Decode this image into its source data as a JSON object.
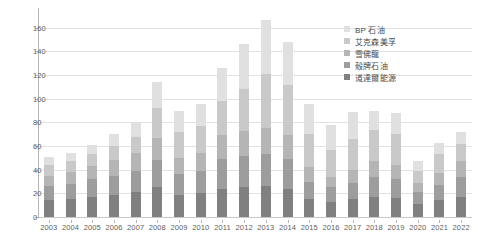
{
  "chart_data": {
    "type": "bar",
    "stacked": true,
    "title": "",
    "subtitle": "",
    "xlabel": "",
    "ylabel": "",
    "ylim": [
      0,
      170
    ],
    "y_ticks": [
      0,
      20,
      40,
      60,
      80,
      100,
      120,
      140,
      160
    ],
    "grid": true,
    "legend_position": "top-right",
    "categories": [
      "2003",
      "2004",
      "2005",
      "2006",
      "2007",
      "2008",
      "2009",
      "2010",
      "2011",
      "2012",
      "2013",
      "2014",
      "2015",
      "2016",
      "2017",
      "2018",
      "2019",
      "2020",
      "2021",
      "2022"
    ],
    "series": [
      {
        "name": "道達爾能源",
        "color": "#808080",
        "values": [
          14,
          15,
          17,
          19,
          21,
          25,
          19,
          20,
          24,
          25,
          26,
          24,
          15,
          13,
          15,
          17,
          16,
          11,
          14,
          17
        ]
      },
      {
        "name": "殼牌石油",
        "color": "#9d9d9d",
        "values": [
          12,
          13,
          15,
          16,
          18,
          23,
          17,
          19,
          25,
          27,
          27,
          25,
          15,
          12,
          14,
          17,
          16,
          10,
          13,
          17
        ]
      },
      {
        "name": "雪佛龍",
        "color": "#b5b5b5",
        "values": [
          9,
          10,
          11,
          13,
          15,
          19,
          14,
          15,
          20,
          21,
          22,
          20,
          12,
          9,
          11,
          13,
          12,
          8,
          10,
          13
        ]
      },
      {
        "name": "艾克森美孚",
        "color": "#c9c9c9",
        "values": [
          9,
          9,
          10,
          12,
          14,
          25,
          22,
          23,
          29,
          35,
          46,
          43,
          28,
          23,
          26,
          27,
          26,
          10,
          16,
          15
        ]
      },
      {
        "name": "BP 石油",
        "color": "#e0e0e0",
        "values": [
          7,
          7,
          8,
          10,
          12,
          22,
          18,
          19,
          28,
          38,
          46,
          36,
          26,
          21,
          23,
          16,
          18,
          8,
          10,
          10
        ]
      }
    ],
    "totals": [
      51,
      54,
      61,
      70,
      80,
      114,
      90,
      96,
      126,
      146,
      167,
      148,
      96,
      78,
      89,
      90,
      88,
      47,
      63,
      72
    ]
  },
  "legend": {
    "items": [
      {
        "label": "BP 石油",
        "color": "#e0e0e0"
      },
      {
        "label": "艾克森美孚",
        "color": "#c9c9c9"
      },
      {
        "label": "雪佛龍",
        "color": "#b5b5b5"
      },
      {
        "label": "殼牌石油",
        "color": "#9d9d9d"
      },
      {
        "label": "道達爾能源",
        "color": "#808080"
      }
    ]
  }
}
